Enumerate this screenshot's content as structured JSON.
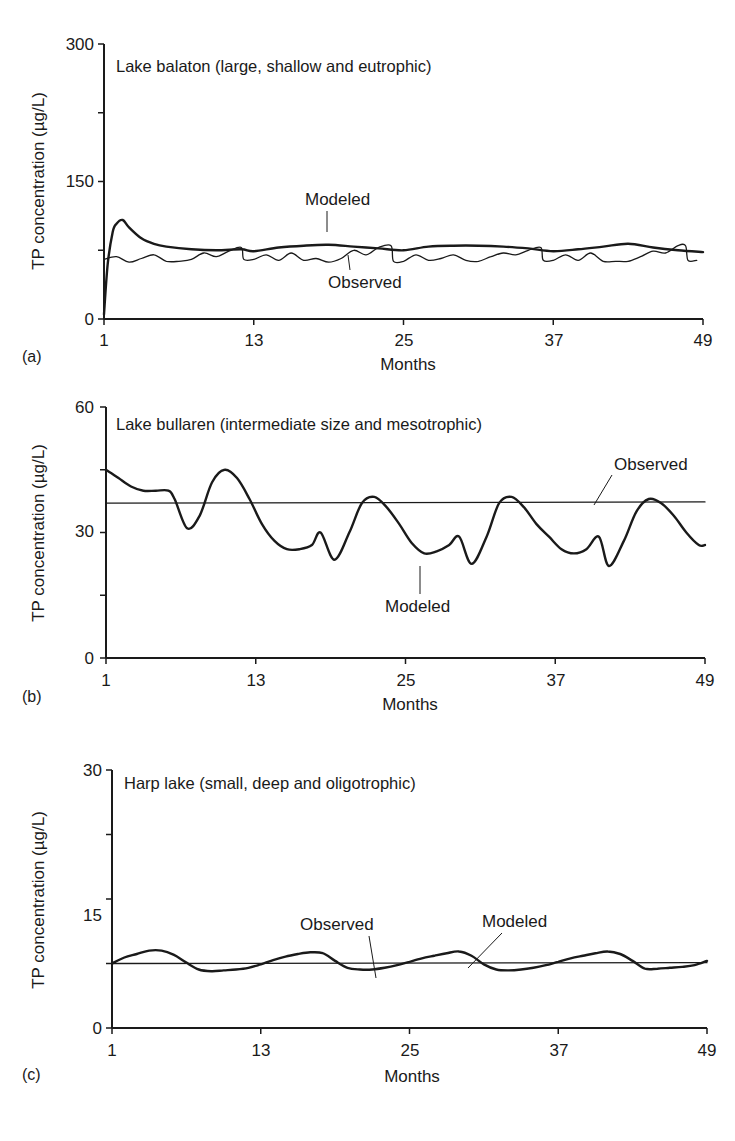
{
  "chart_data": [
    {
      "type": "line",
      "panel": "(a)",
      "title": "Lake balaton (large, shallow and eutrophic)",
      "xlabel": "Months",
      "ylabel": "TP concentration (µg/L)",
      "xlim": [
        1,
        49
      ],
      "ylim": [
        0,
        300
      ],
      "xticks": [
        1,
        13,
        25,
        37,
        49
      ],
      "yticks": [
        0,
        150,
        300
      ],
      "yticks_minor": [
        75,
        225
      ],
      "grid": false,
      "annotations": [
        "Modeled",
        "Observed"
      ],
      "series": [
        {
          "name": "Modeled",
          "style": "thick",
          "x": [
            1,
            1.3,
            1.7,
            2,
            2.5,
            3,
            4,
            5,
            6,
            8,
            10,
            12,
            13,
            15,
            17,
            19,
            21,
            23,
            25,
            27,
            29,
            31,
            33,
            35,
            37,
            39,
            41,
            43,
            45,
            47,
            49
          ],
          "values": [
            5,
            60,
            95,
            104,
            108,
            100,
            88,
            82,
            79,
            76,
            75,
            76,
            74,
            78,
            80,
            81,
            79,
            77,
            75,
            79,
            80,
            80,
            79,
            77,
            74,
            76,
            79,
            82,
            78,
            75,
            73
          ]
        },
        {
          "name": "Observed",
          "style": "thin",
          "x": [
            1,
            2,
            3,
            4,
            5,
            6,
            7,
            8,
            9,
            10,
            11,
            12,
            12.2,
            13,
            14,
            15,
            16,
            17,
            18,
            19,
            20,
            21,
            22,
            23,
            24,
            24.2,
            25,
            26,
            27,
            28,
            29,
            30,
            31,
            32,
            33,
            34,
            35,
            36,
            36.2,
            37,
            38,
            39,
            40,
            41,
            42,
            43,
            44,
            45,
            46,
            47,
            47.6,
            47.8,
            48.5
          ],
          "values": [
            65,
            68,
            62,
            66,
            70,
            63,
            63,
            65,
            72,
            68,
            74,
            78,
            65,
            65,
            70,
            64,
            72,
            64,
            66,
            62,
            66,
            75,
            70,
            78,
            80,
            63,
            63,
            70,
            64,
            66,
            70,
            64,
            63,
            68,
            72,
            70,
            75,
            78,
            64,
            64,
            70,
            64,
            72,
            63,
            63,
            63,
            68,
            74,
            72,
            80,
            80,
            64,
            64
          ]
        }
      ]
    },
    {
      "type": "line",
      "panel": "(b)",
      "title": "Lake bullaren (intermediate size and mesotrophic)",
      "xlabel": "Months",
      "ylabel": "TP concentration (µg/L)",
      "xlim": [
        1,
        49
      ],
      "ylim": [
        0,
        60
      ],
      "xticks": [
        1,
        13,
        25,
        37,
        49
      ],
      "yticks": [
        0,
        30,
        60
      ],
      "yticks_minor": [
        15,
        45
      ],
      "grid": false,
      "annotations": [
        "Observed",
        "Modeled"
      ],
      "series": [
        {
          "name": "Modeled",
          "style": "thick",
          "x": [
            1,
            2,
            3,
            4,
            5,
            6,
            6.5,
            7.5,
            8.5,
            9.5,
            10.5,
            11.5,
            12.5,
            13.5,
            14.5,
            15.5,
            16.5,
            17.5,
            18.2,
            19.3,
            20.5,
            21.5,
            22.5,
            23.5,
            24.5,
            25.5,
            26.5,
            27.5,
            28.5,
            29.3,
            30.3,
            31.5,
            32.5,
            33.5,
            34.5,
            35.5,
            36.5,
            37.5,
            38.5,
            39.5,
            40.5,
            41.3,
            42.5,
            43.5,
            44.5,
            45.5,
            46.5,
            47.5,
            48.5,
            49
          ],
          "values": [
            45,
            43,
            41,
            40,
            40,
            40,
            38,
            31,
            34,
            42,
            45,
            43,
            38,
            32,
            28,
            26,
            26,
            27,
            30,
            23.5,
            30,
            37,
            38.5,
            36,
            32,
            27.5,
            25,
            25.5,
            27,
            29,
            22.5,
            29,
            37,
            38.5,
            36,
            32,
            29,
            26,
            25,
            26,
            29,
            22,
            28,
            35,
            38,
            37,
            34,
            30,
            27,
            27
          ]
        },
        {
          "name": "Observed",
          "style": "thin",
          "x": [
            1,
            49
          ],
          "values": [
            37,
            37.3
          ]
        }
      ]
    },
    {
      "type": "line",
      "panel": "(c)",
      "title": "Harp lake (small, deep and oligotrophic)",
      "xlabel": "Months",
      "ylabel": "TP concentration (µg/L)",
      "xlim": [
        1,
        49
      ],
      "ylim": [
        0,
        30
      ],
      "xticks": [
        1,
        13,
        25,
        37,
        49
      ],
      "yticks": [
        0,
        15,
        30
      ],
      "yticks_minor": [
        7.5,
        22.5
      ],
      "grid": false,
      "annotations": [
        "Observed",
        "Modeled"
      ],
      "series": [
        {
          "name": "Modeled",
          "style": "thick",
          "x": [
            1,
            2,
            3,
            4,
            5,
            6,
            7,
            8,
            9,
            10,
            11,
            12,
            13,
            14,
            15,
            16,
            17,
            18,
            19,
            20,
            21,
            22,
            23,
            24,
            25,
            26,
            27,
            28,
            29,
            30,
            31,
            32,
            33,
            34,
            35,
            36,
            37,
            38,
            39,
            40,
            41,
            42,
            43,
            44,
            45,
            46,
            47,
            48,
            49
          ],
          "values": [
            7.5,
            8.2,
            8.6,
            9.0,
            9.0,
            8.5,
            7.6,
            6.8,
            6.6,
            6.7,
            6.8,
            7.0,
            7.4,
            7.9,
            8.3,
            8.6,
            8.8,
            8.7,
            7.8,
            7.0,
            6.8,
            6.8,
            7.0,
            7.3,
            7.7,
            8.1,
            8.4,
            8.7,
            8.9,
            8.4,
            7.4,
            6.8,
            6.7,
            6.8,
            7.0,
            7.3,
            7.7,
            8.1,
            8.4,
            8.7,
            8.9,
            8.6,
            7.8,
            6.9,
            6.9,
            7.0,
            7.1,
            7.3,
            7.8
          ]
        },
        {
          "name": "Observed",
          "style": "thin",
          "x": [
            1,
            49
          ],
          "values": [
            7.5,
            7.6
          ]
        }
      ]
    }
  ],
  "panels": {
    "a": {
      "letter": "(a)",
      "title": "Lake balaton (large, shallow and eutrophic)",
      "ylabel": "TP concentration (µg/L)",
      "xlabel": "Months",
      "yticks": [
        "0",
        "150",
        "300"
      ],
      "xticks": [
        "1",
        "13",
        "25",
        "37",
        "49"
      ],
      "annot_modeled": "Modeled",
      "annot_observed": "Observed"
    },
    "b": {
      "letter": "(b)",
      "title": "Lake bullaren (intermediate size and mesotrophic)",
      "ylabel": "TP concentration (µg/L)",
      "xlabel": "Months",
      "yticks": [
        "0",
        "30",
        "60"
      ],
      "xticks": [
        "1",
        "13",
        "25",
        "37",
        "49"
      ],
      "annot_modeled": "Modeled",
      "annot_observed": "Observed"
    },
    "c": {
      "letter": "(c)",
      "title": "Harp lake (small, deep and oligotrophic)",
      "ylabel": "TP concentration (µg/L)",
      "xlabel": "Months",
      "yticks": [
        "0",
        "15",
        "30"
      ],
      "xticks": [
        "1",
        "13",
        "25",
        "37",
        "49"
      ],
      "annot_modeled": "Modeled",
      "annot_observed": "Observed"
    }
  },
  "colors": {
    "ink": "#1a1a1a",
    "background": "#ffffff"
  }
}
